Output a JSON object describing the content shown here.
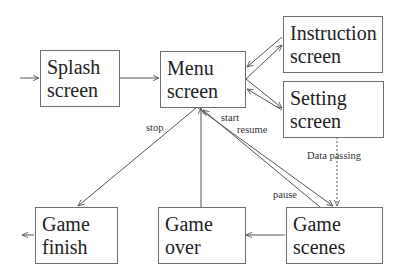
{
  "diagram": {
    "type": "state-flow",
    "nodes": [
      {
        "id": "splash",
        "line1": "Splash",
        "line2": "screen"
      },
      {
        "id": "menu",
        "line1": "Menu",
        "line2": "screen"
      },
      {
        "id": "instruction",
        "line1": "Instruction",
        "line2": "screen"
      },
      {
        "id": "setting",
        "line1": "Setting",
        "line2": "screen"
      },
      {
        "id": "game_finish",
        "line1": "Game",
        "line2": "finish"
      },
      {
        "id": "game_over",
        "line1": "Game",
        "line2": "over"
      },
      {
        "id": "game_scenes",
        "line1": "Game",
        "line2": "scenes"
      }
    ],
    "edge_labels": {
      "stop": "stop",
      "start": "start",
      "resume": "resume",
      "pause": "pause",
      "data_passing": "Data passing"
    },
    "edges": [
      {
        "from": "entry",
        "to": "splash"
      },
      {
        "from": "splash",
        "to": "menu"
      },
      {
        "from": "menu",
        "to": "instruction"
      },
      {
        "from": "instruction",
        "to": "menu"
      },
      {
        "from": "menu",
        "to": "setting"
      },
      {
        "from": "setting",
        "to": "menu"
      },
      {
        "from": "menu",
        "to": "game_finish",
        "label": "stop"
      },
      {
        "from": "game_over",
        "to": "menu"
      },
      {
        "from": "menu",
        "to": "game_scenes",
        "label": "start / resume"
      },
      {
        "from": "game_scenes",
        "to": "menu",
        "label": "pause"
      },
      {
        "from": "setting",
        "to": "game_scenes",
        "label": "Data passing",
        "style": "dashed"
      },
      {
        "from": "game_scenes",
        "to": "game_over"
      },
      {
        "from": "game_finish",
        "to": "exit"
      }
    ],
    "colors": {
      "line": "#555555",
      "border": "#6e6e6e",
      "text": "#222222"
    }
  }
}
